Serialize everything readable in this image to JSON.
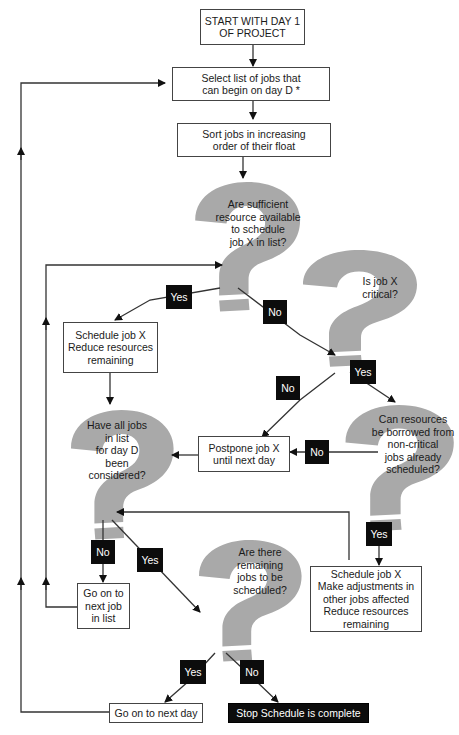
{
  "diagram": {
    "type": "flowchart",
    "colors": {
      "question_fill": "#a9a9a9",
      "box_border": "#444444",
      "label_fill": "#0c0c0c",
      "line": "#3a3a3a"
    },
    "nodes": {
      "start": {
        "lines": [
          "START WITH DAY 1",
          "OF PROJECT"
        ]
      },
      "select": {
        "lines": [
          "Select list of jobs that",
          "can begin on day D *"
        ]
      },
      "sort": {
        "lines": [
          "Sort jobs in increasing",
          "order of their float"
        ]
      },
      "q_sufficient": {
        "lines": [
          "Are sufficient",
          "resource available",
          "to schedule",
          "job X in list?"
        ]
      },
      "q_critical": {
        "lines": [
          "Is job X",
          "critical?"
        ]
      },
      "schedule_reduce": {
        "lines": [
          "Schedule job X",
          "Reduce resources",
          "remaining"
        ]
      },
      "q_all_considered": {
        "lines": [
          "Have all jobs",
          "in list",
          "for day D",
          "been",
          "considered?"
        ]
      },
      "postpone": {
        "lines": [
          "Postpone job X",
          "until next day"
        ]
      },
      "q_borrow": {
        "lines": [
          "Can resources",
          "be borrowed from",
          "non-critical",
          "jobs already",
          "scheduled?"
        ]
      },
      "next_job": {
        "lines": [
          "Go on to",
          "next job",
          "in list"
        ]
      },
      "q_remaining": {
        "lines": [
          "Are there",
          "remaining",
          "jobs to be",
          "scheduled?"
        ]
      },
      "schedule_adjust": {
        "lines": [
          "Schedule job X",
          "Make adjustments in",
          "other jobs affected",
          "Reduce resources",
          "remaining"
        ]
      },
      "next_day": {
        "lines": [
          "Go on to next day"
        ]
      },
      "stop": {
        "lines": [
          "Stop Schedule is complete"
        ]
      }
    },
    "edge_labels": {
      "sufficient_yes": "Yes",
      "sufficient_no": "No",
      "critical_no": "No",
      "critical_yes": "Yes",
      "borrow_no": "No",
      "borrow_yes": "Yes",
      "considered_no": "No",
      "considered_yes": "Yes",
      "remaining_yes": "Yes",
      "remaining_no": "No"
    }
  }
}
